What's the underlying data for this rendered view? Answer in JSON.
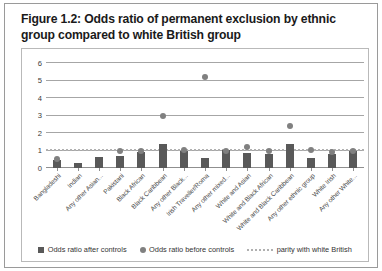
{
  "figure": {
    "title": "Figure 1.2: Odds ratio of permanent exclusion by ethnic group compared to white British group"
  },
  "legend": {
    "items": [
      {
        "label": "Odds ratio after controls",
        "marker": "square-marker-icon",
        "color": "#595959"
      },
      {
        "label": "Odds ratio before controls",
        "marker": "circle-marker-icon",
        "color": "#808080"
      },
      {
        "label": "parity with white British",
        "marker": "dotted-line-icon",
        "color": "#b0b0b0"
      }
    ]
  },
  "chart_data": {
    "type": "bar",
    "title": "Figure 1.2: Odds ratio of permanent exclusion by ethnic group compared to white British group",
    "xlabel": "",
    "ylabel": "",
    "ylim": [
      0,
      6
    ],
    "yticks": [
      0,
      1,
      2,
      3,
      4,
      5,
      6
    ],
    "grid": true,
    "legend_position": "bottom",
    "reference_line": {
      "label": "parity with white British",
      "value": 1,
      "style": "dotted",
      "color": "#b0b0b0"
    },
    "categories": [
      "Bangladeshi",
      "Indian",
      "Any other Asian...",
      "Pakistani",
      "Black African",
      "Black Caribbean",
      "Any other Black...",
      "Irish Traveller/Roma",
      "Any other mixed...",
      "White and Asian",
      "White and Black African",
      "White and Black Caribbean",
      "Any other ethnic group",
      "White Irish",
      "Any other White..."
    ],
    "series": [
      {
        "name": "Odds ratio after controls",
        "color": "#595959",
        "values": [
          0.45,
          0.3,
          0.65,
          0.7,
          0.9,
          1.35,
          1.0,
          0.6,
          1.05,
          0.85,
          0.8,
          1.35,
          0.6,
          0.8,
          0.95
        ]
      },
      {
        "name": "Odds ratio before controls",
        "color": "#808080",
        "values": [
          0.5,
          null,
          null,
          0.95,
          1.0,
          3.0,
          1.05,
          5.2,
          1.0,
          1.2,
          1.0,
          2.4,
          1.05,
          0.9,
          1.0
        ]
      }
    ]
  }
}
